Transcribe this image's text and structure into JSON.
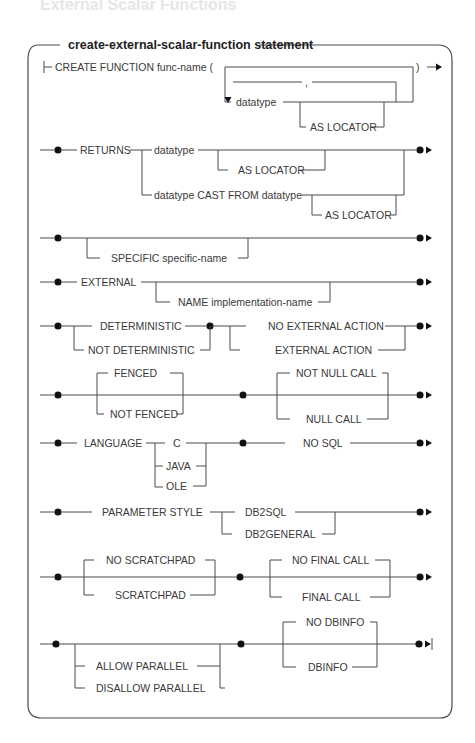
{
  "page": {
    "header_text": "External Scalar Functions"
  },
  "diagram": {
    "title": "create-external-scalar-function statement",
    "rows": [
      {
        "id": "create-function",
        "start": "CREATE FUNCTION func-name (",
        "end": ")",
        "repeat_separator": ",",
        "items": [
          "datatype"
        ],
        "optional": [
          "AS LOCATOR"
        ]
      },
      {
        "id": "returns",
        "keyword": "RETURNS",
        "choices": [
          "datatype",
          "datatype CAST FROM datatype"
        ],
        "optional": [
          "AS LOCATOR",
          "AS LOCATOR"
        ]
      },
      {
        "id": "specific",
        "optional": [
          "SPECIFIC specific-name"
        ]
      },
      {
        "id": "external",
        "keyword": "EXTERNAL",
        "optional": [
          "NAME implementation-name"
        ]
      },
      {
        "id": "deterministic",
        "group1": [
          "DETERMINISTIC",
          "NOT DETERMINISTIC"
        ],
        "group2": [
          "NO EXTERNAL ACTION",
          "EXTERNAL ACTION"
        ]
      },
      {
        "id": "fenced",
        "group1": [
          "FENCED",
          "NOT FENCED"
        ],
        "group2": [
          "NOT NULL CALL",
          "NULL CALL"
        ]
      },
      {
        "id": "language",
        "keyword": "LANGUAGE",
        "choices": [
          "C",
          "JAVA",
          "OLE"
        ],
        "after": "NO SQL"
      },
      {
        "id": "parameter-style",
        "keyword": "PARAMETER STYLE",
        "choices": [
          "DB2SQL",
          "DB2GENERAL"
        ]
      },
      {
        "id": "scratchpad",
        "group1": [
          "NO SCRATCHPAD",
          "SCRATCHPAD"
        ],
        "group2": [
          "NO FINAL CALL",
          "FINAL CALL"
        ]
      },
      {
        "id": "parallel",
        "group1": [
          "ALLOW PARALLEL",
          "DISALLOW PARALLEL"
        ],
        "group2": [
          "NO DBINFO",
          "DBINFO"
        ]
      }
    ]
  }
}
